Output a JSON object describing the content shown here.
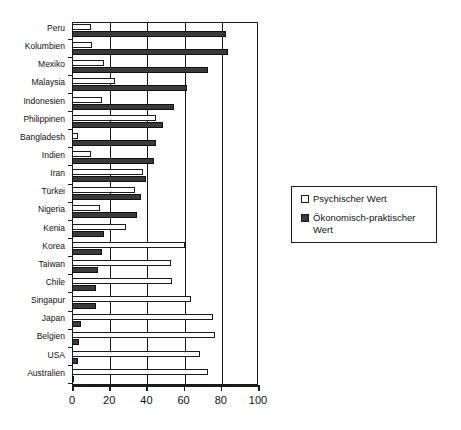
{
  "chart_data": {
    "type": "bar",
    "orientation": "horizontal",
    "title": "",
    "xlabel": "",
    "ylabel": "",
    "xlim": [
      0,
      100
    ],
    "xticks": [
      0,
      20,
      40,
      60,
      80,
      100
    ],
    "grid": true,
    "legend_position": "right",
    "categories": [
      "Peru",
      "Kolumbien",
      "Mexiko",
      "Malaysia",
      "Indonesien",
      "Philippinen",
      "Bangladesh",
      "Indien",
      "Iran",
      "Türkei",
      "Nigeria",
      "Kenia",
      "Korea",
      "Taiwan",
      "Chile",
      "Singapur",
      "Japan",
      "Belgien",
      "USA",
      "Australien"
    ],
    "series": [
      {
        "name": "Psychischer Wert",
        "color": "#ffffff",
        "values": [
          10,
          11,
          17,
          23,
          16,
          45,
          3,
          10,
          38,
          34,
          15,
          29,
          61,
          53,
          54,
          64,
          76,
          77,
          69,
          73
        ]
      },
      {
        "name": "Ökonomisch-praktischer Wert",
        "color": "#3a3a3a",
        "values": [
          83,
          84,
          73,
          62,
          55,
          49,
          45,
          44,
          40,
          37,
          35,
          17,
          16,
          14,
          13,
          13,
          5,
          4,
          3,
          1
        ]
      }
    ]
  },
  "legend": {
    "entries": [
      {
        "label": "Psychischer Wert"
      },
      {
        "label": "Ökonomisch-praktischer Wert"
      }
    ]
  }
}
